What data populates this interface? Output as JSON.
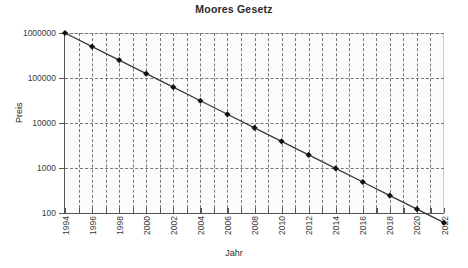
{
  "chart_data": {
    "type": "line",
    "title": "Moores Gesetz",
    "xlabel": "Jahr",
    "ylabel": "Preis",
    "yscale": "log",
    "ylim": [
      100,
      1000000
    ],
    "xlim": [
      1994,
      2022
    ],
    "grid": true,
    "legend": null,
    "marker": "diamond",
    "line_color": "#3a3a3a",
    "marker_color": "#111111",
    "plot_background": "#fbfbfb",
    "grid_color": "#777777",
    "categories": [
      1994,
      1996,
      1998,
      2000,
      2002,
      2004,
      2006,
      2008,
      2010,
      2012,
      2014,
      2016,
      2018,
      2020,
      2022
    ],
    "x": [
      1994,
      1995,
      1996,
      1997,
      1998,
      1999,
      2000,
      2001,
      2002,
      2003,
      2004,
      2005,
      2006,
      2007,
      2008,
      2009,
      2010,
      2011,
      2012,
      2013,
      2014,
      2015,
      2016,
      2017,
      2018,
      2019,
      2020,
      2021,
      2022
    ],
    "values": [
      1000000,
      500000,
      250000,
      125000,
      62500,
      31250,
      15625,
      7812,
      3906,
      1953,
      977,
      488,
      244,
      122,
      61
    ],
    "series": [
      {
        "name": "Preis",
        "points": [
          {
            "x": 1994,
            "y": 1000000
          },
          {
            "x": 1996,
            "y": 500000
          },
          {
            "x": 1998,
            "y": 250000
          },
          {
            "x": 2000,
            "y": 125000
          },
          {
            "x": 2002,
            "y": 62500
          },
          {
            "x": 2004,
            "y": 31250
          },
          {
            "x": 2006,
            "y": 15625
          },
          {
            "x": 2008,
            "y": 7812
          },
          {
            "x": 2010,
            "y": 3906
          },
          {
            "x": 2012,
            "y": 1953
          },
          {
            "x": 2014,
            "y": 977
          },
          {
            "x": 2016,
            "y": 488
          },
          {
            "x": 2018,
            "y": 244
          },
          {
            "x": 2020,
            "y": 122
          },
          {
            "x": 2022,
            "y": 61
          }
        ]
      }
    ],
    "y_ticks": [
      {
        "value": 100,
        "label": "100"
      },
      {
        "value": 1000,
        "label": "1000"
      },
      {
        "value": 10000,
        "label": "10000"
      },
      {
        "value": 100000,
        "label": "100000"
      },
      {
        "value": 1000000,
        "label": "1000000"
      }
    ],
    "x_ticks": [
      {
        "value": 1994,
        "label": "1994"
      },
      {
        "value": 1995,
        "label": ""
      },
      {
        "value": 1996,
        "label": "1996"
      },
      {
        "value": 1997,
        "label": ""
      },
      {
        "value": 1998,
        "label": "1998"
      },
      {
        "value": 1999,
        "label": ""
      },
      {
        "value": 2000,
        "label": "2000"
      },
      {
        "value": 2001,
        "label": ""
      },
      {
        "value": 2002,
        "label": "2002"
      },
      {
        "value": 2003,
        "label": ""
      },
      {
        "value": 2004,
        "label": "2004"
      },
      {
        "value": 2005,
        "label": ""
      },
      {
        "value": 2006,
        "label": "2006"
      },
      {
        "value": 2007,
        "label": ""
      },
      {
        "value": 2008,
        "label": "2008"
      },
      {
        "value": 2009,
        "label": ""
      },
      {
        "value": 2010,
        "label": "2010"
      },
      {
        "value": 2011,
        "label": ""
      },
      {
        "value": 2012,
        "label": "2012"
      },
      {
        "value": 2013,
        "label": ""
      },
      {
        "value": 2014,
        "label": "2014"
      },
      {
        "value": 2015,
        "label": ""
      },
      {
        "value": 2016,
        "label": "2016"
      },
      {
        "value": 2017,
        "label": ""
      },
      {
        "value": 2018,
        "label": "2018"
      },
      {
        "value": 2019,
        "label": ""
      },
      {
        "value": 2020,
        "label": "2020"
      },
      {
        "value": 2021,
        "label": ""
      },
      {
        "value": 2022,
        "label": "2022"
      }
    ]
  }
}
